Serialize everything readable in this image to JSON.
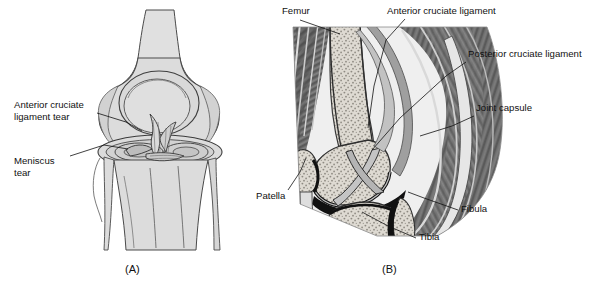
{
  "figure": {
    "background_color": "#ffffff",
    "ink_color": "#111111"
  },
  "panels": [
    {
      "id": "A",
      "caption": "(A)",
      "description": "Anterior view line drawing of knee showing torn anterior cruciate ligament and torn meniscus",
      "fill_light": "#dddddd",
      "fill_mid": "#c9c9c9",
      "labels": [
        {
          "name": "acl-tear",
          "line1": "Anterior cruciate",
          "line2": "ligament tear",
          "x": 14,
          "y": 100
        },
        {
          "name": "meniscus-tear",
          "line1": "Meniscus",
          "line2": "tear",
          "x": 14,
          "y": 156
        }
      ]
    },
    {
      "id": "B",
      "caption": "(B)",
      "description": "Sagittal cross-section of the knee showing femur, patella, tibia, fibula, cruciate ligaments and joint capsule",
      "bone_fill": "#d8d4cc",
      "muscle_fill": "#6e6e6e",
      "cartilage_fill": "#b8b8b8",
      "joint_space": "#111111",
      "labels": [
        {
          "name": "femur",
          "text": "Femur",
          "x": 282,
          "y": 6
        },
        {
          "name": "anterior-cruciate-ligament",
          "text": "Anterior cruciate ligament",
          "x": 388,
          "y": 6
        },
        {
          "name": "posterior-cruciate-ligament",
          "text": "Posterior cruciate ligament",
          "x": 468,
          "y": 50
        },
        {
          "name": "joint-capsule",
          "text": "Joint capsule",
          "x": 476,
          "y": 104
        },
        {
          "name": "patella",
          "text": "Patella",
          "x": 258,
          "y": 194
        },
        {
          "name": "fibula",
          "text": "Fibula",
          "x": 463,
          "y": 206
        },
        {
          "name": "tibia",
          "text": "Tibia",
          "x": 420,
          "y": 234
        }
      ]
    }
  ],
  "captions": {
    "panel_a": "(A)",
    "panel_b": "(B)"
  }
}
